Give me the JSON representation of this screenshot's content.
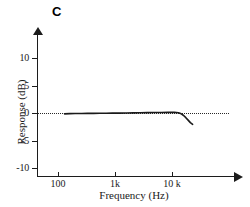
{
  "panel": {
    "label": "C"
  },
  "chart_data": {
    "type": "line",
    "title": "C",
    "xlabel": "Frequency (Hz)",
    "ylabel": "Response (dB)",
    "xscale": "log",
    "xlim": [
      70,
      40000
    ],
    "ylim": [
      -12,
      12
    ],
    "grid": false,
    "legend": null,
    "reference_line": {
      "y": 0,
      "style": "dotted"
    },
    "xticks": [
      100,
      1000,
      10000
    ],
    "xticklabels": [
      "100",
      "1k",
      "10 k"
    ],
    "yticks": [
      10,
      5,
      0,
      -5,
      -10
    ],
    "yticklabels": [
      "10",
      "5",
      "0",
      "-5",
      "-10"
    ],
    "series": [
      {
        "name": "Response",
        "color": "#1a1a1a",
        "x": [
          130,
          160,
          200,
          260,
          330,
          420,
          540,
          700,
          900,
          1200,
          1600,
          2100,
          2800,
          3700,
          4900,
          6500,
          8600,
          11000,
          13000,
          14500,
          16000,
          17500,
          19000,
          21000,
          23000
        ],
        "y": [
          -0.15,
          -0.12,
          -0.1,
          -0.08,
          -0.07,
          -0.06,
          -0.05,
          -0.04,
          -0.03,
          -0.02,
          0.0,
          0.02,
          0.04,
          0.06,
          0.08,
          0.1,
          0.12,
          0.12,
          0.05,
          -0.15,
          -0.45,
          -0.85,
          -1.25,
          -1.75,
          -2.05
        ]
      }
    ]
  }
}
